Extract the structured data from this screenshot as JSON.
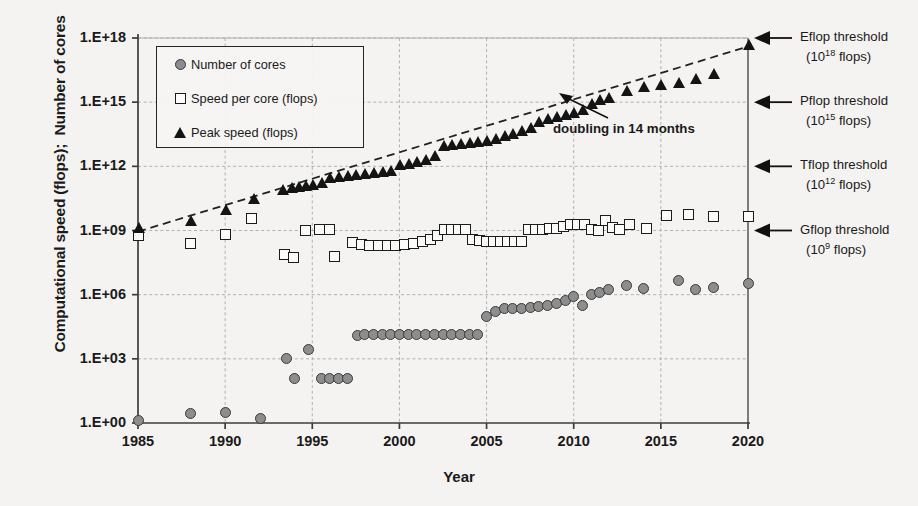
{
  "chart_data": {
    "type": "scatter",
    "title": "",
    "xlabel": "Year",
    "ylabel": "Computational speed (flops);  Number of cores",
    "xlim": [
      1985,
      2020
    ],
    "ylim": [
      0,
      18
    ],
    "xticks": [
      "1985",
      "1990",
      "1995",
      "2000",
      "2005",
      "2010",
      "2015",
      "2020"
    ],
    "xtick_values": [
      1985,
      1990,
      1995,
      2000,
      2005,
      2010,
      2015,
      2020
    ],
    "yticks": [
      "1.E+00",
      "1.E+03",
      "1.E+06",
      "1.E+09",
      "1.E+12",
      "1.E+15",
      "1.E+18"
    ],
    "ytick_values": [
      0,
      3,
      6,
      9,
      12,
      15,
      18
    ],
    "yscale": "log10-exponent",
    "grid": true,
    "legend_position": "upper-left-inside",
    "legend": [
      {
        "marker": "circle-gray",
        "label": "Number of cores"
      },
      {
        "marker": "square-open",
        "label": "Speed per core (flops)"
      },
      {
        "marker": "triangle-filled",
        "label": "Peak speed (flops)"
      }
    ],
    "series": [
      {
        "name": "Number of cores",
        "marker": "circle-gray",
        "points": [
          [
            1985,
            0.1
          ],
          [
            1988,
            0.45
          ],
          [
            1990,
            0.5
          ],
          [
            1992,
            0.2
          ],
          [
            1993.5,
            3.0
          ],
          [
            1994,
            2.1
          ],
          [
            1994.8,
            3.45
          ],
          [
            1995.5,
            2.1
          ],
          [
            1996,
            2.1
          ],
          [
            1996.5,
            2.1
          ],
          [
            1997,
            2.1
          ],
          [
            1997.6,
            4.1
          ],
          [
            1998,
            4.15
          ],
          [
            1998.5,
            4.15
          ],
          [
            1999,
            4.15
          ],
          [
            1999.5,
            4.15
          ],
          [
            2000,
            4.15
          ],
          [
            2000.5,
            4.15
          ],
          [
            2001,
            4.15
          ],
          [
            2001.5,
            4.15
          ],
          [
            2002,
            4.15
          ],
          [
            2002.5,
            4.15
          ],
          [
            2003,
            4.15
          ],
          [
            2003.5,
            4.15
          ],
          [
            2004,
            4.15
          ],
          [
            2004.5,
            4.15
          ],
          [
            2005,
            5.0
          ],
          [
            2005.5,
            5.2
          ],
          [
            2006,
            5.35
          ],
          [
            2006.5,
            5.35
          ],
          [
            2007,
            5.35
          ],
          [
            2007.5,
            5.4
          ],
          [
            2008,
            5.45
          ],
          [
            2008.5,
            5.5
          ],
          [
            2009,
            5.6
          ],
          [
            2009.5,
            5.75
          ],
          [
            2010,
            5.9
          ],
          [
            2010.5,
            5.5
          ],
          [
            2011,
            6.0
          ],
          [
            2011.5,
            6.1
          ],
          [
            2012,
            6.25
          ],
          [
            2013,
            6.45
          ],
          [
            2014,
            6.3
          ],
          [
            2016,
            6.65
          ],
          [
            2017,
            6.25
          ],
          [
            2018,
            6.35
          ],
          [
            2020,
            6.5
          ]
        ]
      },
      {
        "name": "Speed per core (flops)",
        "marker": "square-open",
        "points": [
          [
            1985,
            8.75
          ],
          [
            1988,
            8.4
          ],
          [
            1990,
            8.8
          ],
          [
            1991.5,
            9.55
          ],
          [
            1993.4,
            7.9
          ],
          [
            1993.9,
            7.75
          ],
          [
            1994.6,
            9.0
          ],
          [
            1995.4,
            9.05
          ],
          [
            1996,
            9.05
          ],
          [
            1996.3,
            7.8
          ],
          [
            1997.3,
            8.45
          ],
          [
            1997.8,
            8.35
          ],
          [
            1998.3,
            8.3
          ],
          [
            1998.8,
            8.3
          ],
          [
            1999.3,
            8.3
          ],
          [
            1999.8,
            8.3
          ],
          [
            2000.3,
            8.35
          ],
          [
            2000.8,
            8.4
          ],
          [
            2001.3,
            8.5
          ],
          [
            2001.8,
            8.6
          ],
          [
            2002.2,
            8.75
          ],
          [
            2002.6,
            9.05
          ],
          [
            2003,
            9.05
          ],
          [
            2003.4,
            9.05
          ],
          [
            2003.8,
            9.05
          ],
          [
            2004.2,
            8.6
          ],
          [
            2004.6,
            8.55
          ],
          [
            2005,
            8.5
          ],
          [
            2005.4,
            8.5
          ],
          [
            2005.8,
            8.5
          ],
          [
            2006.2,
            8.5
          ],
          [
            2006.6,
            8.5
          ],
          [
            2007,
            8.5
          ],
          [
            2007.4,
            9.05
          ],
          [
            2007.8,
            9.05
          ],
          [
            2008.2,
            9.05
          ],
          [
            2008.6,
            9.1
          ],
          [
            2009,
            9.1
          ],
          [
            2009.4,
            9.2
          ],
          [
            2009.8,
            9.3
          ],
          [
            2010.2,
            9.3
          ],
          [
            2010.6,
            9.3
          ],
          [
            2011,
            9.05
          ],
          [
            2011.4,
            9.0
          ],
          [
            2011.8,
            9.45
          ],
          [
            2012.2,
            9.15
          ],
          [
            2012.6,
            9.05
          ],
          [
            2013.2,
            9.3
          ],
          [
            2014.2,
            9.1
          ],
          [
            2015.3,
            9.7
          ],
          [
            2016.6,
            9.75
          ],
          [
            2018,
            9.65
          ],
          [
            2020,
            9.65
          ]
        ]
      },
      {
        "name": "Peak speed (flops)",
        "marker": "triangle-filled",
        "points": [
          [
            1985,
            9.1
          ],
          [
            1988,
            9.45
          ],
          [
            1990,
            9.95
          ],
          [
            1991.6,
            10.45
          ],
          [
            1993.3,
            10.9
          ],
          [
            1993.8,
            11.0
          ],
          [
            1994.2,
            11.05
          ],
          [
            1994.6,
            11.1
          ],
          [
            1995,
            11.15
          ],
          [
            1995.5,
            11.2
          ],
          [
            1996,
            11.45
          ],
          [
            1996.5,
            11.5
          ],
          [
            1997,
            11.55
          ],
          [
            1997.5,
            11.6
          ],
          [
            1998,
            11.65
          ],
          [
            1998.5,
            11.7
          ],
          [
            1999,
            11.75
          ],
          [
            1999.5,
            11.8
          ],
          [
            2000,
            12.05
          ],
          [
            2000.5,
            12.1
          ],
          [
            2001,
            12.2
          ],
          [
            2001.5,
            12.3
          ],
          [
            2002,
            12.5
          ],
          [
            2002.5,
            12.95
          ],
          [
            2003,
            13.0
          ],
          [
            2003.5,
            13.05
          ],
          [
            2004,
            13.1
          ],
          [
            2004.5,
            13.15
          ],
          [
            2005,
            13.2
          ],
          [
            2005.5,
            13.3
          ],
          [
            2006,
            13.4
          ],
          [
            2006.5,
            13.5
          ],
          [
            2007,
            13.65
          ],
          [
            2007.5,
            13.8
          ],
          [
            2008,
            14.05
          ],
          [
            2008.5,
            14.2
          ],
          [
            2009,
            14.3
          ],
          [
            2009.5,
            14.4
          ],
          [
            2010,
            14.5
          ],
          [
            2010.5,
            14.65
          ],
          [
            2011,
            14.9
          ],
          [
            2011.5,
            15.1
          ],
          [
            2012,
            15.2
          ],
          [
            2013,
            15.5
          ],
          [
            2014,
            15.7
          ],
          [
            2015,
            15.8
          ],
          [
            2016,
            15.9
          ],
          [
            2017,
            16.1
          ],
          [
            2018,
            16.3
          ],
          [
            2020,
            17.65
          ]
        ]
      }
    ],
    "trendline": {
      "label": "doubling in 14 months",
      "style": "dashed",
      "start": [
        1985,
        8.95
      ],
      "end": [
        2020,
        17.6
      ]
    },
    "annotations": [
      {
        "name": "eflop",
        "line1": "Eflop threshold",
        "line2_pre": "(10",
        "line2_sup": "18",
        "line2_post": " flops)",
        "y_value": 18
      },
      {
        "name": "pflop",
        "line1": "Pflop threshold",
        "line2_pre": "(10",
        "line2_sup": "15",
        "line2_post": " flops)",
        "y_value": 15
      },
      {
        "name": "tflop",
        "line1": "Tflop threshold",
        "line2_pre": "(10",
        "line2_sup": "12",
        "line2_post": " flops)",
        "y_value": 12
      },
      {
        "name": "gflop",
        "line1": "Gflop threshold",
        "line2_pre": "(10",
        "line2_sup": "9",
        "line2_post": "  flops)",
        "y_value": 9
      }
    ],
    "colors": {
      "background": "#f4f3f1",
      "axis": "#3c3c3c",
      "grid": "#a9a9a9",
      "circle_fill": "#8d8d8d",
      "circle_edge": "#3a3a3a",
      "square_fill": "#fbfbfa",
      "square_edge": "#1c1c1c",
      "triangle_fill": "#141414",
      "text": "#1a1a1a"
    }
  }
}
